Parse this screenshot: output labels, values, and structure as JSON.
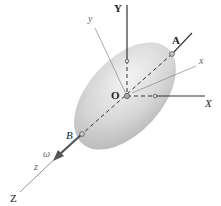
{
  "diagram": {
    "fixed_axes": {
      "X": "X",
      "Y": "Y",
      "Z": "Z"
    },
    "body_axes": {
      "x": "x",
      "y": "y",
      "z": "z"
    },
    "points": {
      "O": "O",
      "A": "A",
      "B": "B"
    },
    "angular_velocity": "ω",
    "colors": {
      "body": "#c8c8c8",
      "body_highlight": "#f2f2f2",
      "axis": "#333333",
      "thin_axis": "#888888"
    }
  }
}
